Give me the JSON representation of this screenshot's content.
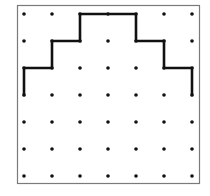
{
  "figure": {
    "type": "dot-grid-path",
    "frame": {
      "x": 17,
      "y": 5,
      "width": 182,
      "height": 178,
      "stroke": "#7a7a7a"
    },
    "grid": {
      "columns": 7,
      "rows": 7,
      "origin_x": 24,
      "origin_y": 14,
      "step_x": 28,
      "step_y": 27,
      "dot_radius": 1.8,
      "dot_color": "#111111"
    },
    "path": {
      "stroke": "#111111",
      "stroke_width": 2.6,
      "points": [
        [
          0,
          3
        ],
        [
          0,
          2
        ],
        [
          1,
          2
        ],
        [
          1,
          1
        ],
        [
          2,
          1
        ],
        [
          2,
          0
        ],
        [
          4,
          0
        ],
        [
          4,
          1
        ],
        [
          5,
          1
        ],
        [
          5,
          2
        ],
        [
          6,
          2
        ],
        [
          6,
          3
        ]
      ]
    }
  }
}
